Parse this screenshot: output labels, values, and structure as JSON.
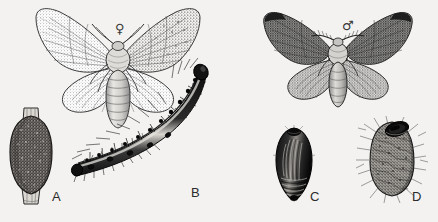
{
  "plate": {
    "title": "Moth life-cycle illustration plate",
    "background_color": "#f3f2f0",
    "ink_color": "#1c1c1c",
    "width": 438,
    "height": 222
  },
  "figures": [
    {
      "key": "A",
      "label": "A",
      "name": "egg-mass-on-twig",
      "caption": "Egg mass on twig",
      "label_x": 52,
      "label_y": 196
    },
    {
      "key": "B",
      "label": "B",
      "name": "caterpillar-larva",
      "caption": "Caterpillar (larva)",
      "label_x": 191,
      "label_y": 192
    },
    {
      "key": "C",
      "label": "C",
      "name": "pupa",
      "caption": "Pupa",
      "label_x": 310,
      "label_y": 196
    },
    {
      "key": "D",
      "label": "D",
      "name": "cocoon",
      "caption": "Cocoon",
      "label_x": 412,
      "label_y": 196
    }
  ],
  "adults": [
    {
      "key": "female",
      "symbol": "♀",
      "name": "female-moth",
      "caption": "Female moth",
      "symbol_x": 115,
      "symbol_y": 22
    },
    {
      "key": "male",
      "symbol": "♂",
      "name": "male-moth",
      "caption": "Male moth",
      "symbol_x": 342,
      "symbol_y": 19
    }
  ]
}
